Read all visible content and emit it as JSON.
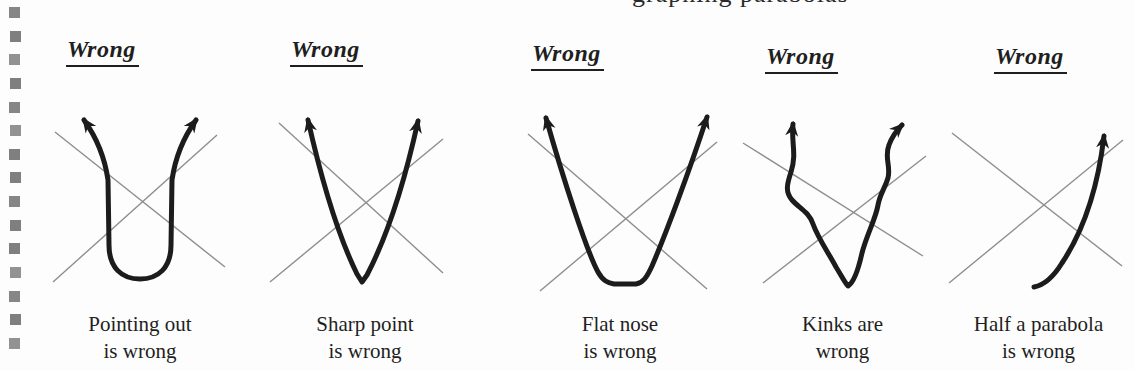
{
  "page": {
    "top_cropped_text": "graphing parabolas"
  },
  "binding": {
    "hole_count": 15
  },
  "colors": {
    "background": "#fdfdfd",
    "ink": "#1f1f1f",
    "curve": "#1c1c1c",
    "guide": "#8e8e8e",
    "binding": "#7f7f7f"
  },
  "panels": [
    {
      "heading": "Wrong",
      "figure": "pointing-out-parabola",
      "caption": [
        "Pointing out",
        "is wrong"
      ]
    },
    {
      "heading": "Wrong",
      "figure": "sharp-point-parabola",
      "caption": [
        "Sharp point",
        "is wrong"
      ]
    },
    {
      "heading": "Wrong",
      "figure": "flat-nose-parabola",
      "caption": [
        "Flat nose",
        "is wrong"
      ]
    },
    {
      "heading": "Wrong",
      "figure": "kinked-parabola",
      "caption": [
        "Kinks are",
        "wrong"
      ]
    },
    {
      "heading": "Wrong",
      "figure": "half-parabola",
      "caption": [
        "Half a parabola",
        "is wrong"
      ]
    }
  ]
}
